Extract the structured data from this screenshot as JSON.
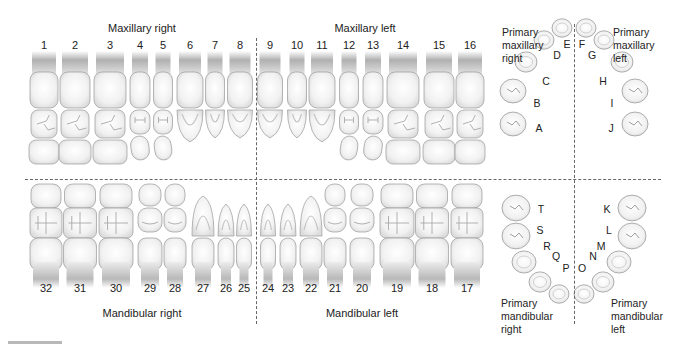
{
  "permanent": {
    "quadrants": {
      "maxillary_right": "Maxillary right",
      "maxillary_left": "Maxillary left",
      "mandibular_right": "Mandibular right",
      "mandibular_left": "Mandibular left"
    },
    "upper_teeth": [
      {
        "num": "1",
        "x": 44,
        "w": 28,
        "type": "molar"
      },
      {
        "num": "2",
        "x": 75,
        "w": 30,
        "type": "molar"
      },
      {
        "num": "3",
        "x": 110,
        "w": 32,
        "type": "molar"
      },
      {
        "num": "4",
        "x": 140,
        "w": 20,
        "type": "premolar"
      },
      {
        "num": "5",
        "x": 163,
        "w": 19,
        "type": "premolar"
      },
      {
        "num": "6",
        "x": 190,
        "w": 26,
        "type": "canine"
      },
      {
        "num": "7",
        "x": 215,
        "w": 19,
        "type": "incisor"
      },
      {
        "num": "8",
        "x": 240,
        "w": 25,
        "type": "incisor"
      },
      {
        "num": "9",
        "x": 270,
        "w": 25,
        "type": "incisor"
      },
      {
        "num": "10",
        "x": 297,
        "w": 19,
        "type": "incisor"
      },
      {
        "num": "11",
        "x": 322,
        "w": 26,
        "type": "canine"
      },
      {
        "num": "12",
        "x": 349,
        "w": 19,
        "type": "premolar"
      },
      {
        "num": "13",
        "x": 373,
        "w": 20,
        "type": "premolar"
      },
      {
        "num": "14",
        "x": 403,
        "w": 32,
        "type": "molar"
      },
      {
        "num": "15",
        "x": 439,
        "w": 30,
        "type": "molar"
      },
      {
        "num": "16",
        "x": 470,
        "w": 28,
        "type": "molar"
      }
    ],
    "lower_teeth": [
      {
        "num": "32",
        "x": 46,
        "w": 32,
        "type": "molar"
      },
      {
        "num": "31",
        "x": 80,
        "w": 33,
        "type": "molar"
      },
      {
        "num": "30",
        "x": 116,
        "w": 34,
        "type": "molar"
      },
      {
        "num": "29",
        "x": 150,
        "w": 24,
        "type": "premolar"
      },
      {
        "num": "28",
        "x": 175,
        "w": 22,
        "type": "premolar"
      },
      {
        "num": "27",
        "x": 203,
        "w": 22,
        "type": "canine"
      },
      {
        "num": "26",
        "x": 226,
        "w": 16,
        "type": "incisor"
      },
      {
        "num": "25",
        "x": 244,
        "w": 15,
        "type": "incisor"
      },
      {
        "num": "24",
        "x": 268,
        "w": 15,
        "type": "incisor"
      },
      {
        "num": "23",
        "x": 288,
        "w": 16,
        "type": "incisor"
      },
      {
        "num": "22",
        "x": 311,
        "w": 22,
        "type": "canine"
      },
      {
        "num": "21",
        "x": 335,
        "w": 22,
        "type": "premolar"
      },
      {
        "num": "20",
        "x": 362,
        "w": 24,
        "type": "premolar"
      },
      {
        "num": "19",
        "x": 397,
        "w": 34,
        "type": "molar"
      },
      {
        "num": "18",
        "x": 432,
        "w": 33,
        "type": "molar"
      },
      {
        "num": "17",
        "x": 467,
        "w": 32,
        "type": "molar"
      }
    ]
  },
  "primary": {
    "labels": {
      "maxillary_right": [
        "Primary",
        "maxillary",
        "right"
      ],
      "maxillary_left": [
        "Primary",
        "maxillary",
        "left"
      ],
      "mandibular_right": [
        "Primary",
        "mandibular",
        "right"
      ],
      "mandibular_left": [
        "Primary",
        "mandibular",
        "left"
      ]
    },
    "upper_teeth": [
      {
        "letter": "A",
        "tx": 513,
        "ty": 124,
        "lx": 539,
        "ly": 128,
        "r": 13
      },
      {
        "letter": "B",
        "tx": 513,
        "ty": 91,
        "lx": 537,
        "ly": 103,
        "r": 13
      },
      {
        "letter": "C",
        "tx": 526,
        "ty": 62,
        "lx": 546,
        "ly": 81,
        "r": 11
      },
      {
        "letter": "D",
        "tx": 544,
        "ty": 40,
        "lx": 557,
        "ly": 55,
        "r": 10
      },
      {
        "letter": "E",
        "tx": 562,
        "ty": 28,
        "lx": 567,
        "ly": 44,
        "r": 10
      },
      {
        "letter": "F",
        "tx": 586,
        "ty": 28,
        "lx": 582,
        "ly": 44,
        "r": 10
      },
      {
        "letter": "G",
        "tx": 604,
        "ty": 40,
        "lx": 592,
        "ly": 55,
        "r": 10
      },
      {
        "letter": "H",
        "tx": 622,
        "ty": 62,
        "lx": 603,
        "ly": 81,
        "r": 11
      },
      {
        "letter": "I",
        "tx": 635,
        "ty": 91,
        "lx": 612,
        "ly": 103,
        "r": 13
      },
      {
        "letter": "J",
        "tx": 635,
        "ty": 124,
        "lx": 611,
        "ly": 128,
        "r": 13
      }
    ],
    "lower_teeth": [
      {
        "letter": "T",
        "tx": 516,
        "ty": 208,
        "lx": 541,
        "ly": 209,
        "r": 14
      },
      {
        "letter": "S",
        "tx": 516,
        "ty": 236,
        "lx": 540,
        "ly": 230,
        "r": 14
      },
      {
        "letter": "R",
        "tx": 524,
        "ty": 262,
        "lx": 547,
        "ly": 246,
        "r": 12
      },
      {
        "letter": "Q",
        "tx": 540,
        "ty": 282,
        "lx": 556,
        "ly": 256,
        "r": 11
      },
      {
        "letter": "P",
        "tx": 559,
        "ty": 294,
        "lx": 566,
        "ly": 268,
        "r": 10
      },
      {
        "letter": "O",
        "tx": 584,
        "ty": 294,
        "lx": 582,
        "ly": 268,
        "r": 10
      },
      {
        "letter": "N",
        "tx": 603,
        "ty": 282,
        "lx": 593,
        "ly": 256,
        "r": 11
      },
      {
        "letter": "M",
        "tx": 619,
        "ty": 262,
        "lx": 601,
        "ly": 246,
        "r": 12
      },
      {
        "letter": "L",
        "tx": 632,
        "ty": 236,
        "lx": 609,
        "ly": 230,
        "r": 14
      },
      {
        "letter": "K",
        "tx": 632,
        "ty": 208,
        "lx": 607,
        "ly": 209,
        "r": 14
      }
    ]
  },
  "colors": {
    "tooth_fill": "#f2f2f2",
    "tooth_stroke": "#9a9a9a",
    "root_top": "#a8a8a8",
    "root_bottom": "#eeeeee",
    "divider": "#666666",
    "scalebar": "#b8b8b8"
  }
}
